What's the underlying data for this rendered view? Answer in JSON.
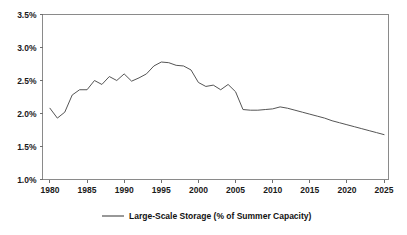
{
  "chart_data": {
    "type": "line",
    "title": "",
    "xlabel": "",
    "ylabel": "",
    "xlim": [
      1979.0,
      2025.6
    ],
    "ylim": [
      1.0,
      3.5
    ],
    "grid": false,
    "legend_position": "bottom-center",
    "y_tick_labels": [
      "3.5%",
      "3.0%",
      "2.5%",
      "2.0%",
      "1.5%",
      "1.0%"
    ],
    "y_tick_values": [
      3.5,
      3.0,
      2.5,
      2.0,
      1.5,
      1.0
    ],
    "x_tick_labels": [
      "1980",
      "1985",
      "1990",
      "1995",
      "2000",
      "2005",
      "2010",
      "2015",
      "2020",
      "2025"
    ],
    "x_tick_values": [
      1980,
      1985,
      1990,
      1995,
      2000,
      2005,
      2010,
      2015,
      2020,
      2025
    ],
    "series": [
      {
        "name": "Large-Scale Storage (% of Summer Capacity)",
        "color": "#555555",
        "x": [
          1980,
          1981,
          1982,
          1983,
          1984,
          1985,
          1986,
          1987,
          1988,
          1989,
          1990,
          1991,
          1992,
          1993,
          1994,
          1995,
          1996,
          1997,
          1998,
          1999,
          2000,
          2001,
          2002,
          2003,
          2004,
          2005,
          2006,
          2007,
          2008,
          2009,
          2010,
          2011,
          2012,
          2013,
          2014,
          2015,
          2016,
          2017,
          2018,
          2019,
          2020,
          2021,
          2022,
          2023,
          2024,
          2025
        ],
        "values": [
          2.08,
          1.93,
          2.02,
          2.28,
          2.36,
          2.36,
          2.5,
          2.44,
          2.56,
          2.5,
          2.6,
          2.49,
          2.54,
          2.6,
          2.72,
          2.78,
          2.77,
          2.73,
          2.72,
          2.66,
          2.47,
          2.41,
          2.43,
          2.36,
          2.44,
          2.33,
          2.06,
          2.05,
          2.05,
          2.06,
          2.07,
          2.1,
          2.08,
          2.05,
          2.02,
          1.99,
          1.96,
          1.93,
          1.89,
          1.86,
          1.83,
          1.8,
          1.77,
          1.74,
          1.71,
          1.68
        ]
      }
    ]
  },
  "legend": {
    "entries": [
      {
        "label": "Large-Scale Storage (% of Summer Capacity)",
        "color": "#555555"
      }
    ]
  }
}
